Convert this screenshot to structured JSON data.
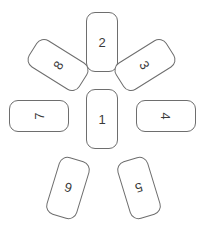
{
  "diagram": {
    "type": "radial-card-arrangement",
    "title": "",
    "background_color": "#ffffff",
    "stroke_color": "#6e6e6e",
    "text_color": "#3a3a3a",
    "canvas": {
      "width": 207,
      "height": 239
    },
    "card_style": {
      "corner_radius": 9,
      "stroke_width": 1,
      "portrait_size": {
        "width": 32,
        "height": 60
      },
      "font_size": 13
    },
    "cards": [
      {
        "id": "card-1",
        "label": "1",
        "position": "center",
        "left": 86,
        "top": 89,
        "width": 32,
        "height": 60,
        "card_rotation": 0,
        "label_rotation": 0
      },
      {
        "id": "card-2",
        "label": "2",
        "position": "top",
        "left": 86,
        "top": 12,
        "width": 32,
        "height": 60,
        "card_rotation": 0,
        "label_rotation": 0
      },
      {
        "id": "card-3",
        "label": "3",
        "position": "top-right",
        "left": 129,
        "top": 35,
        "width": 32,
        "height": 60,
        "card_rotation": 58,
        "label_rotation": 58
      },
      {
        "id": "card-4",
        "label": "4",
        "position": "right",
        "left": 150,
        "top": 86,
        "width": 32,
        "height": 60,
        "card_rotation": 90,
        "label_rotation": 90
      },
      {
        "id": "card-5",
        "label": "5",
        "position": "bottom-right",
        "left": 123,
        "top": 158,
        "width": 32,
        "height": 60,
        "card_rotation": 163,
        "label_rotation": 163
      },
      {
        "id": "card-6",
        "label": "6",
        "position": "bottom-left",
        "left": 52,
        "top": 158,
        "width": 32,
        "height": 60,
        "card_rotation": 197,
        "label_rotation": 197
      },
      {
        "id": "card-7",
        "label": "7",
        "position": "left",
        "left": 23,
        "top": 86,
        "width": 32,
        "height": 60,
        "card_rotation": 270,
        "label_rotation": 270
      },
      {
        "id": "card-8",
        "label": "8",
        "position": "top-left",
        "left": 42,
        "top": 35,
        "width": 32,
        "height": 60,
        "card_rotation": 302,
        "label_rotation": 302
      }
    ]
  }
}
